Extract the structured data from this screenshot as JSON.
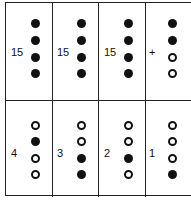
{
  "top_row": [
    {
      "label": "15",
      "dots": [
        "filled",
        "filled",
        "filled",
        "filled"
      ]
    },
    {
      "label": "15",
      "dots": [
        "filled",
        "filled",
        "filled",
        "filled"
      ]
    },
    {
      "label": "15",
      "dots": [
        "filled",
        "filled",
        "filled",
        "filled"
      ]
    },
    {
      "label": "+",
      "dots": [
        "filled",
        "filled",
        "open",
        "open"
      ]
    }
  ],
  "bottom_row": [
    {
      "label": "4",
      "dots": [
        "open",
        "filled",
        "open",
        "open"
      ]
    },
    {
      "label": "3",
      "dots": [
        "open",
        "open",
        "filled",
        "filled"
      ]
    },
    {
      "label": "2",
      "dots": [
        "open",
        "open",
        "filled",
        "open"
      ]
    },
    {
      "label": "1",
      "dots": [
        "open",
        "open",
        "open",
        "filled"
      ]
    }
  ]
}
